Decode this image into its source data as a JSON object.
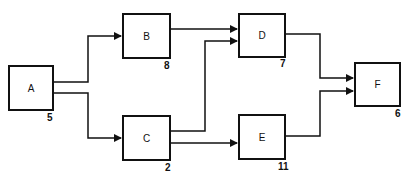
{
  "diagram": {
    "type": "activity-network",
    "nodes": [
      {
        "id": "A",
        "label": "A",
        "duration": "5"
      },
      {
        "id": "B",
        "label": "B",
        "duration": "8"
      },
      {
        "id": "C",
        "label": "C",
        "duration": "2"
      },
      {
        "id": "D",
        "label": "D",
        "duration": "7"
      },
      {
        "id": "E",
        "label": "E",
        "duration": "11"
      },
      {
        "id": "F",
        "label": "F",
        "duration": "6"
      }
    ],
    "edges": [
      {
        "from": "A",
        "to": "B"
      },
      {
        "from": "A",
        "to": "C"
      },
      {
        "from": "B",
        "to": "D"
      },
      {
        "from": "C",
        "to": "D"
      },
      {
        "from": "C",
        "to": "E"
      },
      {
        "from": "D",
        "to": "F"
      },
      {
        "from": "E",
        "to": "F"
      }
    ]
  }
}
